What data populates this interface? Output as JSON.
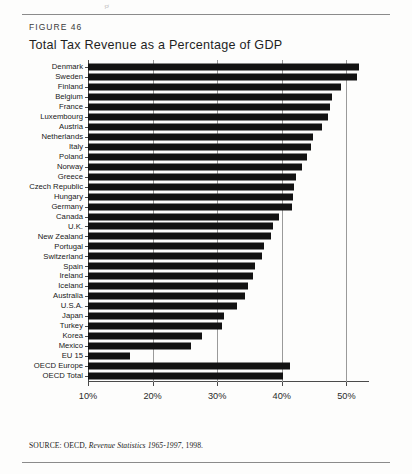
{
  "figure": {
    "label": "FIGURE 46",
    "title": "Total Tax Revenue as a Percentage of GDP",
    "source_prefix": "SOURCE: OECD,",
    "source_italic": "Revenue Statistics 1965-1997",
    "source_suffix": ", 1998.",
    "scan_sliver": "g"
  },
  "colors": {
    "bar": "#121212",
    "grid": "#9a9a9a",
    "axis": "#4a4a4a",
    "rule": "#8b8b8b",
    "page": "#fdfdfc"
  },
  "chart_data": {
    "type": "bar",
    "orientation": "horizontal",
    "title": "Total Tax Revenue as a Percentage of GDP",
    "xlabel": "",
    "ylabel": "",
    "xlim": [
      10,
      53.5
    ],
    "xticks": [
      10,
      20,
      30,
      40,
      50
    ],
    "xtick_labels": [
      "10%",
      "20%",
      "30%",
      "40%",
      "50%"
    ],
    "grid": true,
    "legend": false,
    "categories": [
      "Denmark",
      "Sweden",
      "Finland",
      "Belgium",
      "France",
      "Luxembourg",
      "Austria",
      "Netherlands",
      "Italy",
      "Poland",
      "Norway",
      "Greece",
      "Czech Republic",
      "Hungary",
      "Germany",
      "Canada",
      "U.K.",
      "New Zealand",
      "Portugal",
      "Switzerland",
      "Spain",
      "Ireland",
      "Iceland",
      "Australia",
      "U.S.A.",
      "Japan",
      "Turkey",
      "Korea",
      "Mexico",
      "EU 15",
      "OECD Europe",
      "OECD Total"
    ],
    "values": [
      52.0,
      51.6,
      49.2,
      47.7,
      47.4,
      47.2,
      46.3,
      44.8,
      44.5,
      43.9,
      43.2,
      42.2,
      41.9,
      41.7,
      41.6,
      39.5,
      38.6,
      38.4,
      37.2,
      36.9,
      35.8,
      35.6,
      34.7,
      34.3,
      33.0,
      31.0,
      30.7,
      27.6,
      25.9,
      16.5,
      41.3,
      40.2
    ],
    "value_unit": "%",
    "note": "Bars begin at the 10% baseline; Denmark and Sweden extend past the 50% gridline."
  }
}
